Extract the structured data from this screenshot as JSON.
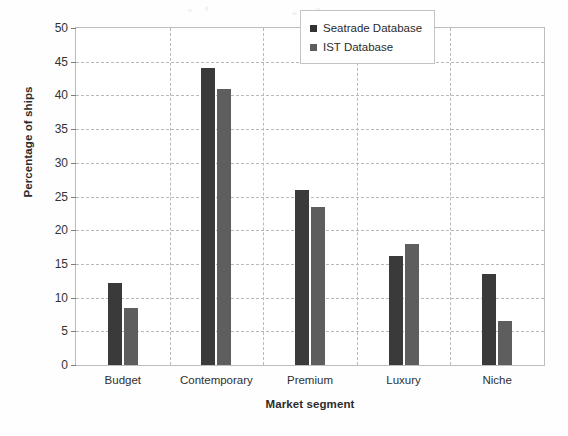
{
  "chart_data": {
    "type": "bar",
    "title": "",
    "subtitle": "",
    "xlabel": "Market segment",
    "ylabel": "Percentage of ships",
    "categories": [
      "Budget",
      "Contemporary",
      "Premium",
      "Luxury",
      "Niche"
    ],
    "series": [
      {
        "name": "Seatrade Database",
        "color": "#3a3a3a",
        "values": [
          12.2,
          44.0,
          26.0,
          16.2,
          13.5
        ]
      },
      {
        "name": "IST Database",
        "color": "#5e5e5e",
        "values": [
          8.5,
          41.0,
          23.4,
          18.0,
          6.6
        ]
      }
    ],
    "ylim": [
      0,
      50
    ],
    "ytick_step": 5,
    "yticks": [
      0,
      5,
      10,
      15,
      20,
      25,
      30,
      35,
      40,
      45,
      50
    ],
    "ytick_labels": [
      "0",
      "5",
      "10",
      "15",
      "20",
      "25",
      "30",
      "35",
      "40",
      "45",
      "50"
    ],
    "grid": {
      "horizontal": true,
      "vertical": true,
      "style": "dashed",
      "color": "#b9b9b9"
    },
    "legend": {
      "position": "upper-right-inside",
      "entries": [
        "Seatrade Database",
        "IST Database"
      ]
    }
  },
  "colors": {
    "series_seatrade": "#3a3a3a",
    "series_ist": "#5e5e5e",
    "grid": "#b9b9b9",
    "axis": "#7d7d7d",
    "text": "#2b2b2b",
    "background": "#fefefe"
  }
}
